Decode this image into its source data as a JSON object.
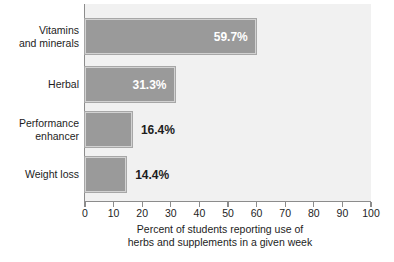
{
  "chart_data": {
    "type": "bar",
    "orientation": "horizontal",
    "title": "",
    "categories": [
      "Vitamins and minerals",
      "Herbal",
      "Performance enhancer",
      "Weight loss"
    ],
    "values": [
      59.7,
      31.3,
      16.4,
      14.4
    ],
    "value_labels": [
      "59.7%",
      "31.3%",
      "16.4%",
      "14.4%"
    ],
    "label_placement": [
      "inside",
      "inside",
      "outside",
      "outside"
    ],
    "xlabel": "Percent of students reporting use of herbs and supplements in a given week",
    "ylabel": "",
    "xlim": [
      0,
      100
    ],
    "xticks": [
      0,
      10,
      20,
      30,
      40,
      50,
      60,
      70,
      80,
      90,
      100
    ],
    "xtick_labels": [
      "0",
      "10",
      "20",
      "30",
      "40",
      "50",
      "60",
      "70",
      "80",
      "90",
      "100"
    ],
    "grid": false,
    "legend": null,
    "colors": {
      "bar_fill": "#9a9a9a",
      "bar_inner_border": "#d2d2d2",
      "bar_outer_border": "#a7a7a7",
      "plot_background": "#f1f1f1",
      "axis": "#8c8c8c",
      "text": "#1d1d1d",
      "inside_label_text": "#ffffff"
    }
  },
  "axis": {
    "x_caption_line1": "Percent of students reporting use of",
    "x_caption_line2": "herbs and supplements in a given week"
  },
  "categories_display": [
    {
      "line1": "Vitamins",
      "line2": "and minerals"
    },
    {
      "line1": "Herbal",
      "line2": ""
    },
    {
      "line1": "Performance",
      "line2": "enhancer"
    },
    {
      "line1": "Weight loss",
      "line2": ""
    }
  ]
}
